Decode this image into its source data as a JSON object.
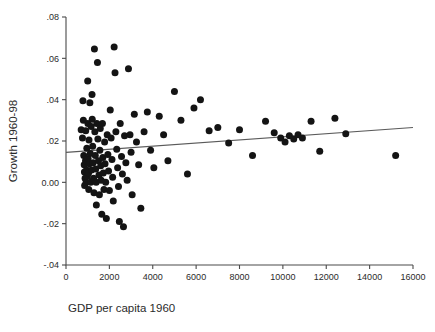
{
  "chart_data": {
    "type": "scatter",
    "title": "",
    "xlabel": "GDP per capita 1960",
    "ylabel": "Growth 1960-98",
    "xlim": [
      0,
      16000
    ],
    "ylim": [
      -0.04,
      0.08
    ],
    "grid": false,
    "legend": null,
    "xticks": [
      0,
      2000,
      4000,
      6000,
      8000,
      10000,
      12000,
      14000,
      16000
    ],
    "xticklabels": [
      "0",
      "2000",
      "4000",
      "6000",
      "8000",
      "10000",
      "12000",
      "14000",
      "16000"
    ],
    "yticks": [
      0.08,
      0.06,
      0.04,
      0.02,
      0.0,
      -0.02,
      -0.04
    ],
    "yticklabels": [
      ".08",
      ".06",
      ".04",
      ".02",
      "0.00",
      "-.02",
      "-.04"
    ],
    "marker": {
      "shape": "circle",
      "color": "#141414",
      "size_px": 7
    },
    "fit_line": {
      "kind": "linear-regression",
      "color": "#5a5a5a",
      "x": [
        0,
        16000
      ],
      "y": [
        0.0145,
        0.0265
      ]
    },
    "points": [
      [
        700,
        0.0255
      ],
      [
        760,
        0.0215
      ],
      [
        780,
        0.0395
      ],
      [
        800,
        0.03
      ],
      [
        820,
        0.013
      ],
      [
        840,
        0.0085
      ],
      [
        850,
        0.005
      ],
      [
        860,
        -0.0015
      ],
      [
        880,
        0.002
      ],
      [
        900,
        0.0105
      ],
      [
        910,
        0.025
      ],
      [
        930,
        0.0
      ],
      [
        950,
        0.006
      ],
      [
        960,
        0.0165
      ],
      [
        980,
        0.003
      ],
      [
        1000,
        0.049
      ],
      [
        1010,
        0.0285
      ],
      [
        1020,
        0.0115
      ],
      [
        1040,
        0.0045
      ],
      [
        1050,
        -0.0035
      ],
      [
        1060,
        0.0205
      ],
      [
        1080,
        0.009
      ],
      [
        1100,
        0.0385
      ],
      [
        1120,
        0.014
      ],
      [
        1140,
        0.0
      ],
      [
        1160,
        0.027
      ],
      [
        1180,
        0.006
      ],
      [
        1200,
        0.0425
      ],
      [
        1210,
        0.0305
      ],
      [
        1230,
        0.0175
      ],
      [
        1250,
        0.0095
      ],
      [
        1270,
        0.002
      ],
      [
        1290,
        -0.005
      ],
      [
        1310,
        0.0645
      ],
      [
        1330,
        0.0245
      ],
      [
        1350,
        0.013
      ],
      [
        1370,
        0.0065
      ],
      [
        1390,
        0.0
      ],
      [
        1400,
        -0.011
      ],
      [
        1420,
        0.0285
      ],
      [
        1450,
        0.058
      ],
      [
        1470,
        0.021
      ],
      [
        1500,
        0.0105
      ],
      [
        1520,
        0.0035
      ],
      [
        1540,
        -0.006
      ],
      [
        1560,
        0.0155
      ],
      [
        1580,
        0.026
      ],
      [
        1600,
        0.008
      ],
      [
        1620,
        0.001
      ],
      [
        1650,
        -0.0155
      ],
      [
        1680,
        0.0285
      ],
      [
        1700,
        0.012
      ],
      [
        1720,
        0.0045
      ],
      [
        1750,
        -0.0035
      ],
      [
        1780,
        0.0195
      ],
      [
        1800,
        0.009
      ],
      [
        1830,
        0.0
      ],
      [
        1860,
        -0.0175
      ],
      [
        1900,
        0.023
      ],
      [
        1930,
        0.0135
      ],
      [
        1960,
        0.0055
      ],
      [
        2000,
        -0.004
      ],
      [
        2040,
        0.035
      ],
      [
        2080,
        0.0215
      ],
      [
        2120,
        0.011
      ],
      [
        2150,
        0.0025
      ],
      [
        2180,
        -0.009
      ],
      [
        2220,
        0.0655
      ],
      [
        2260,
        0.053
      ],
      [
        2300,
        0.0245
      ],
      [
        2340,
        0.016
      ],
      [
        2380,
        0.007
      ],
      [
        2420,
        -0.002
      ],
      [
        2460,
        -0.019
      ],
      [
        2500,
        0.0285
      ],
      [
        2560,
        0.0125
      ],
      [
        2600,
        0.004
      ],
      [
        2650,
        -0.0215
      ],
      [
        2700,
        0.0225
      ],
      [
        2760,
        0.0095
      ],
      [
        2820,
        0.001
      ],
      [
        2880,
        0.055
      ],
      [
        2950,
        0.023
      ],
      [
        3000,
        0.0145
      ],
      [
        3050,
        -0.006
      ],
      [
        3150,
        0.033
      ],
      [
        3250,
        0.0195
      ],
      [
        3350,
        0.0085
      ],
      [
        3450,
        -0.0125
      ],
      [
        3600,
        0.0245
      ],
      [
        3750,
        0.034
      ],
      [
        3900,
        0.0155
      ],
      [
        4050,
        0.007
      ],
      [
        4300,
        0.032
      ],
      [
        4500,
        0.023
      ],
      [
        4700,
        0.0105
      ],
      [
        5000,
        0.044
      ],
      [
        5300,
        0.03
      ],
      [
        5600,
        0.004
      ],
      [
        5900,
        0.036
      ],
      [
        6200,
        0.04
      ],
      [
        6600,
        0.025
      ],
      [
        7000,
        0.0265
      ],
      [
        7500,
        0.019
      ],
      [
        8000,
        0.0255
      ],
      [
        8600,
        0.013
      ],
      [
        9200,
        0.0295
      ],
      [
        9600,
        0.024
      ],
      [
        9900,
        0.0215
      ],
      [
        10100,
        0.0195
      ],
      [
        10300,
        0.0225
      ],
      [
        10500,
        0.021
      ],
      [
        10700,
        0.023
      ],
      [
        10900,
        0.0215
      ],
      [
        11300,
        0.0295
      ],
      [
        11700,
        0.015
      ],
      [
        12400,
        0.031
      ],
      [
        12900,
        0.0235
      ],
      [
        15200,
        0.013
      ]
    ]
  }
}
